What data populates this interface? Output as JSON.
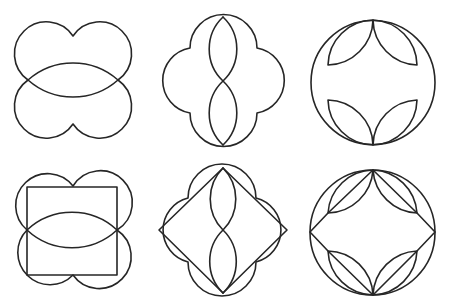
{
  "style": {
    "background": "#ffffff",
    "stroke_color": "#262626",
    "stroke_width": 1.6
  },
  "figures": [
    {
      "id": "fig-1",
      "position": "top-left",
      "description": "Two overlapping cloud shapes (double lobes) forming a central lens",
      "paths": [
        "M28,80 A32,32 0 1,1 73,36 A32,32 0 1,1 118,80 A68,68 0 0,1 28,80",
        "M28,80 A32,32 0 1,0 73,124 A32,32 0 1,0 118,80 A68,68 0 0,0 28,80"
      ]
    },
    {
      "id": "fig-2",
      "position": "top-middle",
      "description": "Four-lobed quatrefoil with two stacked vertical lenses",
      "paths": [
        "M190,48 A33,33 0 0,1 257,48 A33,33 0 0,1 257,113 A33,33 0 0,1 190,113 A33,33 0 0,1 190,48 Z",
        "M223,17 A44,44 0 0,0 223,81 A44,44 0 0,0 223,145",
        "M223,17 A44,44 0 0,1 223,81 A44,44 0 0,1 223,145"
      ]
    },
    {
      "id": "fig-3",
      "position": "top-right",
      "description": "Circle with four leaf (vesica) shapes at top and bottom",
      "paths": [
        "M311,82.5 A62,62 0 1,1 435,82.5 A62,62 0 1,1 311,82.5 Z",
        "M373,20 A46,46 0 0,0 328,65 A46,46 0 0,0 373,20",
        "M373,20 A46,46 0 0,1 417,65 A46,46 0 0,1 373,20",
        "M373,145 A46,46 0 0,1 328,100 A46,46 0 0,1 373,145",
        "M373,145 A46,46 0 0,0 417,100 A46,46 0 0,0 373,145"
      ]
    },
    {
      "id": "fig-4",
      "position": "bottom-left",
      "description": "Double-lobe figure with central lens and inscribed square",
      "paths": [
        "M27,230 A32,32 0 1,1 73,186 A32,32 0 1,1 117,230 A66,66 0 0,1 27,230",
        "M27,230 A32,32 0 1,0 73,275 A32,32 0 1,0 117,230 A66,66 0 0,0 27,230",
        "M27,187 L117,187 L117,275 L27,275 Z"
      ]
    },
    {
      "id": "fig-5",
      "position": "bottom-middle",
      "description": "Quatrefoil with inscribed diamond and two stacked vertical lenses",
      "paths": [
        "M188,198 A33,33 0 0,1 256,198 A33,33 0 0,1 256,262 A33,33 0 0,1 188,262 A33,33 0 0,1 188,198 Z",
        "M223,168 L287,230 L223,293 L159,230 Z",
        "M223,168 A44,44 0 0,0 223,230 A44,44 0 0,0 223,293",
        "M223,168 A44,44 0 0,1 223,230 A44,44 0 0,1 223,293"
      ]
    },
    {
      "id": "fig-6",
      "position": "bottom-right",
      "description": "Circle with four leaves, leaf diagonals and connecting lines to the side points",
      "paths": [
        "M310,232.5 A62.5,62.5 0 1,1 435,232.5 A62.5,62.5 0 1,1 310,232.5 Z",
        "M373,170 A46,46 0 0,0 328,213 A46,46 0 0,0 373,170",
        "M373,170 A46,46 0 0,1 417,213 A46,46 0 0,1 373,170",
        "M373,295 A46,46 0 0,1 328,251 A46,46 0 0,1 373,295",
        "M373,295 A46,46 0 0,0 417,251 A46,46 0 0,0 373,295",
        "M373,170 L328,213 L310,232 L328,251 L373,295 L417,251 L435,232 L417,213 Z"
      ]
    }
  ]
}
